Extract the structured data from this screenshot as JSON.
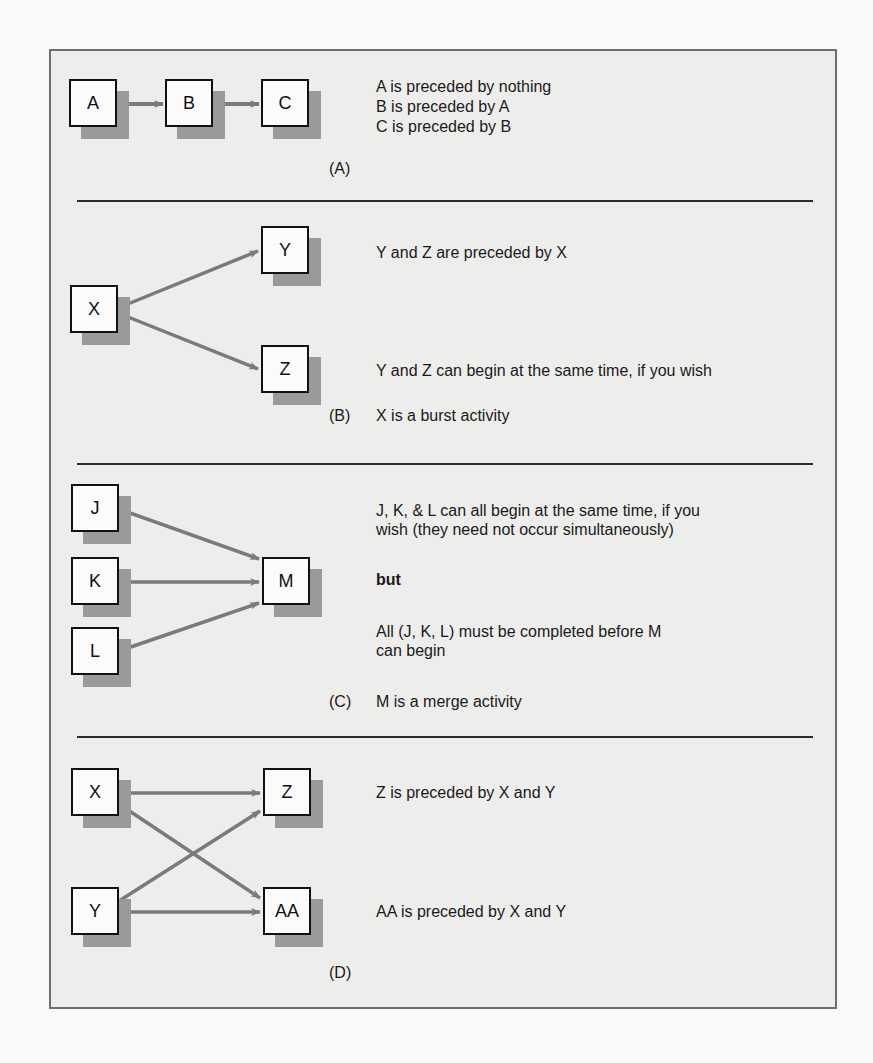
{
  "figure": {
    "arrow_color": "#7a7a7a",
    "frame_background": "#ededec",
    "node_shadow_color": "#9a9a9a"
  },
  "sections": {
    "a": {
      "label": "(A)",
      "nodes": [
        "A",
        "B",
        "C"
      ],
      "lines": [
        "A is preceded by nothing",
        "B is preceded by A",
        "C is preceded by B"
      ]
    },
    "b": {
      "label": "(B)",
      "nodes": [
        "X",
        "Y",
        "Z"
      ],
      "line1": "Y and Z are preceded by X",
      "line2": "Y and Z can begin at the same time, if you wish",
      "caption": "X is a burst activity"
    },
    "c": {
      "label": "(C)",
      "nodes": [
        "J",
        "K",
        "L",
        "M"
      ],
      "line1": "J, K, & L can all begin at the same time, if you wish (they need not occur simultaneously)",
      "line2": "but",
      "line3": "All (J, K, L) must be completed before M can begin",
      "caption": "M is a merge activity"
    },
    "d": {
      "label": "(D)",
      "nodes": [
        "X",
        "Z",
        "Y",
        "AA"
      ],
      "line1": "Z is preceded by X and Y",
      "line2": "AA is preceded by X and Y"
    }
  }
}
